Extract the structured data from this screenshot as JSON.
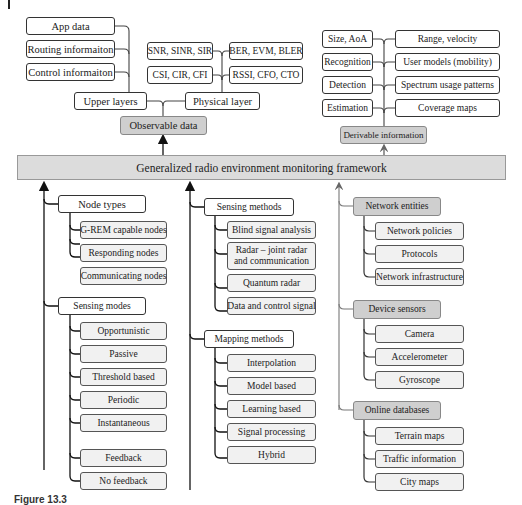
{
  "diagram": {
    "framework": "Generalized radio environment monitoring framework",
    "observable": {
      "label": "Observable data",
      "upper_layers": {
        "label": "Upper layers",
        "items": [
          "App data",
          "Routing informaiton",
          "Control informaiton"
        ]
      },
      "physical_layer": {
        "label": "Physical layer",
        "left_items": [
          "SNR, SINR, SIR",
          "CSI, CIR, CFI"
        ],
        "right_items": [
          "BER, EVM, BLER",
          "RSSI, CFO, CTO"
        ]
      }
    },
    "derivable": {
      "label": "Derivable information",
      "left_items": [
        "Size, AoA",
        "Recognition",
        "Detection",
        "Estimation"
      ],
      "right_items": [
        "Range, velocity",
        "User models (mobility)",
        "Spectrum usage patterns",
        "Coverage maps"
      ]
    },
    "node_types": {
      "label": "Node types",
      "items": [
        "G-REM capable nodes",
        "Responding nodes",
        "Communicating nodes"
      ]
    },
    "sensing_modes": {
      "label": "Sensing modes",
      "items": [
        "Opportunistic",
        "Passive",
        "Threshold based",
        "Periodic",
        "Instantaneous",
        "Feedback",
        "No feedback"
      ]
    },
    "sensing_methods": {
      "label": "Sensing methods",
      "items": [
        "Blind signal analysis",
        "Radar – joint radar and communication",
        "Quantum radar",
        "Data and control signal"
      ]
    },
    "mapping_methods": {
      "label": "Mapping methods",
      "items": [
        "Interpolation",
        "Model based",
        "Learning based",
        "Signal processing",
        "Hybrid"
      ]
    },
    "network_entities": {
      "label": "Network entities",
      "items": [
        "Network policies",
        "Protocols",
        "Network infrastructure"
      ]
    },
    "device_sensors": {
      "label": "Device sensors",
      "items": [
        "Camera",
        "Accelerometer",
        "Gyroscope"
      ]
    },
    "online_databases": {
      "label": "Online databases",
      "items": [
        "Terrain maps",
        "Traffic information",
        "City maps"
      ]
    }
  },
  "caption": "Figure 13.3"
}
